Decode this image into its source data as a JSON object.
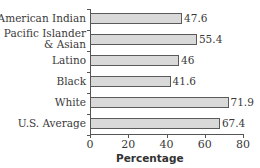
{
  "chart_data": {
    "type": "bar",
    "orientation": "horizontal",
    "title": "",
    "xlabel": "Percentage",
    "ylabel": "",
    "categories": [
      "American Indian",
      "Pacific Islander & Asian",
      "Latino",
      "Black",
      "White",
      "U.S. Average"
    ],
    "category_lines": [
      [
        "American Indian"
      ],
      [
        "Pacific Islander",
        "& Asian"
      ],
      [
        "Latino"
      ],
      [
        "Black"
      ],
      [
        "White"
      ],
      [
        "U.S. Average"
      ]
    ],
    "values": [
      47.6,
      55.4,
      46,
      41.6,
      71.9,
      67.4
    ],
    "value_labels": [
      "47.6",
      "55.4",
      "46",
      "41.6",
      "71.9",
      "67.4"
    ],
    "xlim": [
      0,
      80
    ],
    "xticks": [
      0,
      20,
      40,
      60,
      80
    ],
    "xtick_labels": [
      "0",
      "20",
      "40",
      "60",
      "80"
    ],
    "grid": false,
    "legend": null,
    "colors": {
      "bar_fill": "#d9d9d9",
      "bar_border": "#5a5a5a",
      "axis": "#555555"
    }
  }
}
